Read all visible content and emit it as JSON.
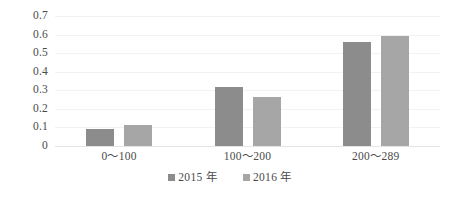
{
  "chart_data": {
    "type": "bar",
    "title": "",
    "subtitle": "",
    "xlabel": "",
    "ylabel": "",
    "categories": [
      "0～100",
      "100～200",
      "200～289"
    ],
    "series": [
      {
        "name": "2015 年",
        "color": "#8c8c8c",
        "values": [
          0.09,
          0.32,
          0.56
        ]
      },
      {
        "name": "2016 年",
        "color": "#a6a6a6",
        "values": [
          0.115,
          0.265,
          0.59
        ]
      }
    ],
    "ylim": [
      0,
      0.7
    ],
    "ytick_values": [
      0,
      0.1,
      0.2,
      0.3,
      0.4,
      0.5,
      0.6,
      0.7
    ],
    "ytick_labels": [
      "0",
      "0.1",
      "0.2",
      "0.3",
      "0.4",
      "0.5",
      "0.6",
      "0.7"
    ],
    "grid": true,
    "grid_axis": "y",
    "grid_color": "#f2f2f2",
    "axis_color": "#e4e4e4",
    "legend_position": "bottom",
    "background_color": "#ffffff",
    "text_color": "#4a4a4a"
  }
}
